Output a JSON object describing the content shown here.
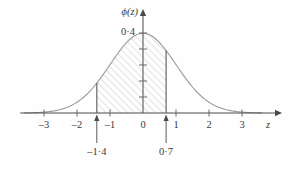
{
  "chart_data": {
    "type": "area",
    "title": "",
    "subtitle": "",
    "xlabel": "z",
    "ylabel": "ϕ(z)",
    "xlim": [
      -3.6,
      3.6
    ],
    "ylim": [
      0,
      0.46
    ],
    "grid": false,
    "legend": null,
    "x_ticks": [
      {
        "value": -3,
        "label": "–3"
      },
      {
        "value": -2,
        "label": "–2"
      },
      {
        "value": -1,
        "label": "–1"
      },
      {
        "value": 0,
        "label": "0"
      },
      {
        "value": 1,
        "label": "1"
      },
      {
        "value": 2,
        "label": "2"
      },
      {
        "value": 3,
        "label": "3"
      }
    ],
    "y_ticks": [
      {
        "value": 0.4,
        "label": "0·4"
      },
      {
        "value": 0.32,
        "label": ""
      },
      {
        "value": 0.24,
        "label": ""
      },
      {
        "value": 0.16,
        "label": ""
      },
      {
        "value": 0.08,
        "label": ""
      }
    ],
    "series": [
      {
        "name": "standard normal density",
        "function": "phi(z) = exp(-z^2/2)/sqrt(2*pi)",
        "x": [
          -3.6,
          -3.2,
          -2.8,
          -2.4,
          -2.0,
          -1.6,
          -1.4,
          -1.2,
          -0.8,
          -0.4,
          0.0,
          0.4,
          0.7,
          0.8,
          1.2,
          1.6,
          2.0,
          2.4,
          2.8,
          3.2,
          3.6
        ],
        "values": [
          0.0006,
          0.0024,
          0.0079,
          0.0224,
          0.054,
          0.1109,
          0.1497,
          0.1942,
          0.2897,
          0.3683,
          0.3989,
          0.3683,
          0.3123,
          0.2897,
          0.1942,
          0.1109,
          0.054,
          0.0224,
          0.0079,
          0.0024,
          0.0006
        ]
      }
    ],
    "shaded_region": {
      "from": -1.4,
      "to": 0.7,
      "fill": "diagonal-hatch",
      "hatch_color": "#b9b9b9"
    },
    "annotations": [
      {
        "name": "lower-bound",
        "value": -1.4,
        "label": "–1·4"
      },
      {
        "name": "upper-bound",
        "value": 0.7,
        "label": "0·7"
      }
    ],
    "colors": {
      "curve": "#9a9a9a",
      "axis": "#4a4a4a",
      "text": "#3a3a3a",
      "background": "#fefefe"
    }
  }
}
